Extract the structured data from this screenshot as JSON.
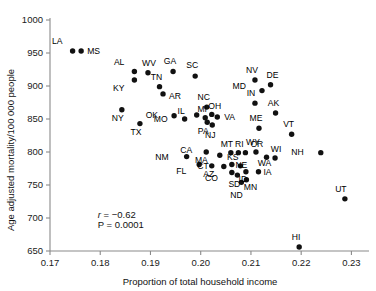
{
  "chart_data": {
    "type": "scatter",
    "title": "",
    "xlabel": "Proportion of total household income",
    "ylabel": "Age adjusted mortality/100 000 people",
    "xlim": [
      0.17,
      0.2335
    ],
    "ylim": [
      650,
      1000
    ],
    "xticks": [
      0.17,
      0.18,
      0.19,
      0.2,
      0.21,
      0.22,
      0.23
    ],
    "xticklabels": [
      "0.17",
      "0.18",
      "0.19",
      "0.20",
      "0.21",
      "0.22",
      "0.23"
    ],
    "yticks": [
      650,
      700,
      750,
      800,
      850,
      900,
      950,
      1000
    ],
    "yticklabels": [
      "650",
      "700",
      "750",
      "800",
      "850",
      "900",
      "950",
      "1000"
    ],
    "grid": false,
    "legend": false,
    "annotations": [
      {
        "text": "r = −0.62",
        "x": 0.1795,
        "y": 700,
        "italic_first": true
      },
      {
        "text": "P = 0.0001",
        "x": 0.1795,
        "y": 685,
        "italic_first": false
      }
    ],
    "points": [
      {
        "label": "LA",
        "x": 0.1745,
        "y": 953,
        "lx": -10,
        "ly": -7
      },
      {
        "label": "MS",
        "x": 0.1762,
        "y": 953,
        "lx": 6,
        "ly": 3
      },
      {
        "label": "AL",
        "x": 0.1868,
        "y": 922,
        "lx": -10,
        "ly": -6
      },
      {
        "label": "WV",
        "x": 0.1895,
        "y": 920,
        "lx": 1,
        "ly": -7
      },
      {
        "label": "KY",
        "x": 0.1868,
        "y": 909,
        "lx": -10,
        "ly": 11
      },
      {
        "label": "TN",
        "x": 0.1918,
        "y": 899,
        "lx": -3,
        "ly": -7
      },
      {
        "label": "AR",
        "x": 0.1925,
        "y": 888,
        "lx": 6,
        "ly": 5
      },
      {
        "label": "GA",
        "x": 0.1945,
        "y": 922,
        "lx": -3,
        "ly": -7
      },
      {
        "label": "SC",
        "x": 0.1989,
        "y": 915,
        "lx": -3,
        "ly": -8
      },
      {
        "label": "NY",
        "x": 0.1843,
        "y": 864,
        "lx": -4,
        "ly": 11
      },
      {
        "label": "TX",
        "x": 0.1879,
        "y": 843,
        "lx": -4,
        "ly": 11
      },
      {
        "label": "OK",
        "x": 0.1947,
        "y": 855,
        "lx": -16,
        "ly": 2
      },
      {
        "label": "MO",
        "x": 0.1968,
        "y": 850,
        "lx": -17,
        "ly": 3
      },
      {
        "label": "IL",
        "x": 0.1992,
        "y": 856,
        "lx": -12,
        "ly": -1
      },
      {
        "label": "MI",
        "x": 0.2009,
        "y": 852,
        "lx": -3,
        "ly": -6
      },
      {
        "label": "NC",
        "x": 0.2012,
        "y": 868,
        "lx": -3,
        "ly": -7
      },
      {
        "label": "OH",
        "x": 0.2022,
        "y": 857,
        "lx": 3,
        "ly": -5
      },
      {
        "label": "PA",
        "x": 0.2013,
        "y": 845,
        "lx": -4,
        "ly": 12
      },
      {
        "label": "VA",
        "x": 0.2033,
        "y": 853,
        "lx": 7,
        "ly": 3
      },
      {
        "label": "NJ",
        "x": 0.2023,
        "y": 841,
        "lx": -2,
        "ly": 13
      },
      {
        "label": "NV",
        "x": 0.2108,
        "y": 909,
        "lx": -3,
        "ly": -7
      },
      {
        "label": "DE",
        "x": 0.2139,
        "y": 902,
        "lx": 2,
        "ly": -7
      },
      {
        "label": "MD",
        "x": 0.2122,
        "y": 893,
        "lx": -16,
        "ly": -2
      },
      {
        "label": "IN",
        "x": 0.2108,
        "y": 874,
        "lx": -4,
        "ly": -7
      },
      {
        "label": "AK",
        "x": 0.2149,
        "y": 859,
        "lx": -2,
        "ly": -7
      },
      {
        "label": "ME",
        "x": 0.2116,
        "y": 836,
        "lx": -3,
        "ly": -7
      },
      {
        "label": "VT",
        "x": 0.2181,
        "y": 827,
        "lx": -3,
        "ly": -7
      },
      {
        "label": "NM",
        "x": 0.1972,
        "y": 793,
        "lx": -18,
        "ly": 3
      },
      {
        "label": "CA",
        "x": 0.2011,
        "y": 800,
        "lx": -14,
        "ly": 1
      },
      {
        "label": "MA",
        "x": 0.2038,
        "y": 795,
        "lx": -12,
        "ly": 8
      },
      {
        "label": "MT",
        "x": 0.206,
        "y": 799,
        "lx": -4,
        "ly": -6
      },
      {
        "label": "RI",
        "x": 0.2075,
        "y": 799,
        "lx": 1,
        "ly": -6
      },
      {
        "label": "OR",
        "x": 0.2089,
        "y": 799,
        "lx": 5,
        "ly": -6
      },
      {
        "label": "WY",
        "x": 0.211,
        "y": 800,
        "lx": -3,
        "ly": -7
      },
      {
        "label": "WA",
        "x": 0.2131,
        "y": 792,
        "lx": -2,
        "ly": 9
      },
      {
        "label": "WI",
        "x": 0.2148,
        "y": 791,
        "lx": 1,
        "ly": -6
      },
      {
        "label": "NH",
        "x": 0.2239,
        "y": 799,
        "lx": -17,
        "ly": 2
      },
      {
        "label": "FL",
        "x": 0.1997,
        "y": 781,
        "lx": -13,
        "ly": 9
      },
      {
        "label": "AZ",
        "x": 0.2022,
        "y": 779,
        "lx": -3,
        "ly": 11
      },
      {
        "label": "CT",
        "x": 0.2046,
        "y": 778,
        "lx": -15,
        "ly": 2
      },
      {
        "label": "KS",
        "x": 0.2062,
        "y": 781,
        "lx": 1,
        "ly": -5
      },
      {
        "label": "NE",
        "x": 0.2079,
        "y": 779,
        "lx": 1,
        "ly": 2
      },
      {
        "label": "CO",
        "x": 0.2062,
        "y": 769,
        "lx": -14,
        "ly": 9
      },
      {
        "label": "SD",
        "x": 0.2073,
        "y": 765,
        "lx": -3,
        "ly": 12
      },
      {
        "label": "ID",
        "x": 0.209,
        "y": 770,
        "lx": -3,
        "ly": 10
      },
      {
        "label": "IA",
        "x": 0.2115,
        "y": 770,
        "lx": 5,
        "ly": 3
      },
      {
        "label": "MN",
        "x": 0.2091,
        "y": 758,
        "lx": 4,
        "ly": 10
      },
      {
        "label": "ND",
        "x": 0.2081,
        "y": 754,
        "lx": -5,
        "ly": 16
      },
      {
        "label": "UT",
        "x": 0.2287,
        "y": 729,
        "lx": -4,
        "ly": -7
      },
      {
        "label": "HI",
        "x": 0.2196,
        "y": 656,
        "lx": -3,
        "ly": -7
      }
    ]
  }
}
